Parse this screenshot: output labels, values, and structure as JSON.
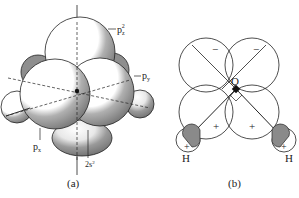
{
  "panel_a": {
    "caption": "(a)",
    "labels": {
      "pz": "p",
      "pz_sub": "z",
      "pz_sup": "2",
      "py": "p",
      "py_sub": "y",
      "px": "p",
      "px_sub": "x",
      "s": "2s",
      "s_sup": "2"
    }
  },
  "panel_b": {
    "caption": "(b)",
    "labels": {
      "oxygen": "O",
      "h_left": "H",
      "h_right": "H",
      "sign_top_left": "−",
      "sign_top_right": "−",
      "sign_bottom_left": "+",
      "sign_bottom_right": "+",
      "sign_h_left": "+",
      "sign_h_right": "+"
    }
  },
  "colors": {
    "shade": "#8a8a8a",
    "line": "#222222",
    "fill": "#ffffff"
  }
}
